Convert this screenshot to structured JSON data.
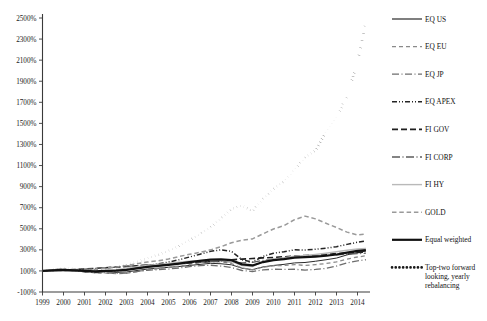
{
  "chart_data": {
    "type": "line",
    "title": "",
    "xlabel": "",
    "ylabel": "",
    "grid": false,
    "legend_position": "right",
    "xlim": [
      1999,
      2014.5
    ],
    "ylim": [
      -100,
      2500
    ],
    "ytick_labels": [
      "2500%",
      "2300%",
      "2100%",
      "1900%",
      "1700%",
      "1500%",
      "1300%",
      "1100%",
      "900%",
      "700%",
      "500%",
      "300%",
      "100%",
      "-100%"
    ],
    "ytick_values": [
      2500,
      2300,
      2100,
      1900,
      1700,
      1500,
      1300,
      1100,
      900,
      700,
      500,
      300,
      100,
      -100
    ],
    "xtick_labels": [
      "1999",
      "2000",
      "2001",
      "2002",
      "2003",
      "2004",
      "2005",
      "2006",
      "2007",
      "2008",
      "2009",
      "2010",
      "2011",
      "2012",
      "2013",
      "2014"
    ],
    "xtick_values": [
      1999,
      2000,
      2001,
      2002,
      2003,
      2004,
      2005,
      2006,
      2007,
      2008,
      2009,
      2010,
      2011,
      2012,
      2013,
      2014
    ],
    "x": [
      1999,
      1999.5,
      2000,
      2000.5,
      2001,
      2001.5,
      2002,
      2002.5,
      2003,
      2003.5,
      2004,
      2004.5,
      2005,
      2005.5,
      2006,
      2006.5,
      2007,
      2007.5,
      2008,
      2008.5,
      2009,
      2009.5,
      2010,
      2010.5,
      2011,
      2011.5,
      2012,
      2012.5,
      2013,
      2013.5,
      2014,
      2014.4
    ],
    "series": [
      {
        "name": "EQ US",
        "style": "solid",
        "color": "#2b2b2b",
        "width": 1.0,
        "values": [
          100,
          108,
          112,
          104,
          96,
          88,
          92,
          86,
          90,
          104,
          118,
          126,
          134,
          142,
          152,
          162,
          172,
          168,
          158,
          126,
          112,
          138,
          152,
          162,
          176,
          180,
          192,
          206,
          222,
          252,
          276,
          288
        ]
      },
      {
        "name": "EQ EU",
        "style": "dashed",
        "color": "#8a8a8a",
        "width": 1.3,
        "values": [
          100,
          110,
          116,
          106,
          94,
          82,
          80,
          74,
          78,
          94,
          112,
          122,
          134,
          146,
          162,
          178,
          192,
          186,
          170,
          128,
          110,
          136,
          148,
          152,
          160,
          152,
          160,
          170,
          186,
          212,
          232,
          244
        ]
      },
      {
        "name": "EQ JP",
        "style": "longdash-dot",
        "color": "#6e6e6e",
        "width": 1.3,
        "values": [
          100,
          112,
          118,
          104,
          92,
          84,
          82,
          76,
          80,
          94,
          106,
          112,
          118,
          128,
          140,
          150,
          154,
          146,
          132,
          104,
          94,
          110,
          116,
          114,
          116,
          108,
          114,
          124,
          146,
          176,
          196,
          206
        ]
      },
      {
        "name": "EQ APEX",
        "style": "dash-dot-dot",
        "color": "#242424",
        "width": 1.5,
        "values": [
          100,
          104,
          108,
          100,
          94,
          90,
          96,
          100,
          112,
          132,
          152,
          166,
          184,
          206,
          232,
          258,
          286,
          300,
          286,
          206,
          184,
          238,
          268,
          282,
          300,
          298,
          306,
          316,
          330,
          352,
          372,
          384
        ]
      },
      {
        "name": "FI GOV",
        "style": "longdash",
        "color": "#1f1f1f",
        "width": 1.6,
        "values": [
          100,
          104,
          108,
          112,
          118,
          124,
          130,
          136,
          142,
          148,
          154,
          158,
          164,
          170,
          176,
          182,
          188,
          196,
          206,
          212,
          218,
          224,
          228,
          234,
          240,
          246,
          252,
          258,
          264,
          270,
          276,
          280
        ]
      },
      {
        "name": "FI CORP",
        "style": "longdash-dot2",
        "color": "#5c5c5c",
        "width": 1.3,
        "values": [
          100,
          104,
          108,
          112,
          118,
          124,
          130,
          136,
          144,
          150,
          156,
          162,
          168,
          174,
          180,
          184,
          188,
          190,
          186,
          176,
          182,
          200,
          212,
          220,
          228,
          234,
          240,
          246,
          252,
          258,
          264,
          268
        ]
      },
      {
        "name": "FI HY",
        "style": "solid",
        "color": "#b9b9b9",
        "width": 1.4,
        "values": [
          100,
          104,
          106,
          104,
          102,
          100,
          104,
          112,
          124,
          140,
          152,
          162,
          172,
          182,
          192,
          200,
          206,
          204,
          192,
          150,
          142,
          188,
          212,
          226,
          240,
          246,
          256,
          268,
          282,
          296,
          308,
          314
        ]
      },
      {
        "name": "GOLD",
        "style": "dashed2",
        "color": "#9a9a9a",
        "width": 1.5,
        "values": [
          100,
          104,
          102,
          100,
          104,
          114,
          128,
          136,
          152,
          168,
          184,
          196,
          214,
          236,
          258,
          276,
          300,
          330,
          368,
          392,
          404,
          452,
          498,
          530,
          586,
          620,
          594,
          552,
          512,
          468,
          440,
          452
        ]
      },
      {
        "name": "Equal weighted",
        "style": "solid",
        "color": "#111111",
        "width": 2.2,
        "values": [
          100,
          106,
          110,
          106,
          100,
          96,
          100,
          102,
          110,
          124,
          138,
          148,
          158,
          170,
          184,
          196,
          208,
          210,
          202,
          162,
          152,
          184,
          202,
          212,
          226,
          230,
          236,
          244,
          256,
          274,
          290,
          298
        ]
      },
      {
        "name": "Top-two forward looking, yearly rebalancing",
        "style": "dotted",
        "color": "#1a1a1a",
        "width": 2.6,
        "values": [
          100,
          112,
          124,
          118,
          112,
          106,
          118,
          132,
          156,
          186,
          220,
          252,
          292,
          336,
          392,
          448,
          516,
          596,
          690,
          720,
          668,
          784,
          880,
          952,
          1060,
          1180,
          1240,
          1420,
          1560,
          1760,
          2080,
          2460
        ]
      }
    ]
  },
  "legend": {
    "items": [
      {
        "label": "EQ US",
        "swatch": "solid-dark"
      },
      {
        "label": "EQ EU",
        "swatch": "dashed-gray"
      },
      {
        "label": "EQ JP",
        "swatch": "longdash-dot-gray"
      },
      {
        "label": "EQ APEX",
        "swatch": "dash-dot-dot-dark"
      },
      {
        "label": "FI GOV",
        "swatch": "longdash-dark"
      },
      {
        "label": "FI CORP",
        "swatch": "longdash-dot-midgray"
      },
      {
        "label": "FI HY",
        "swatch": "solid-lightgray"
      },
      {
        "label": "GOLD",
        "swatch": "dashed-midgray"
      },
      {
        "label": "Equal weighted",
        "swatch": "solid-thick-black"
      },
      {
        "label": "Top-two forward looking, yearly rebalancing",
        "swatch": "dotted-black"
      }
    ]
  }
}
